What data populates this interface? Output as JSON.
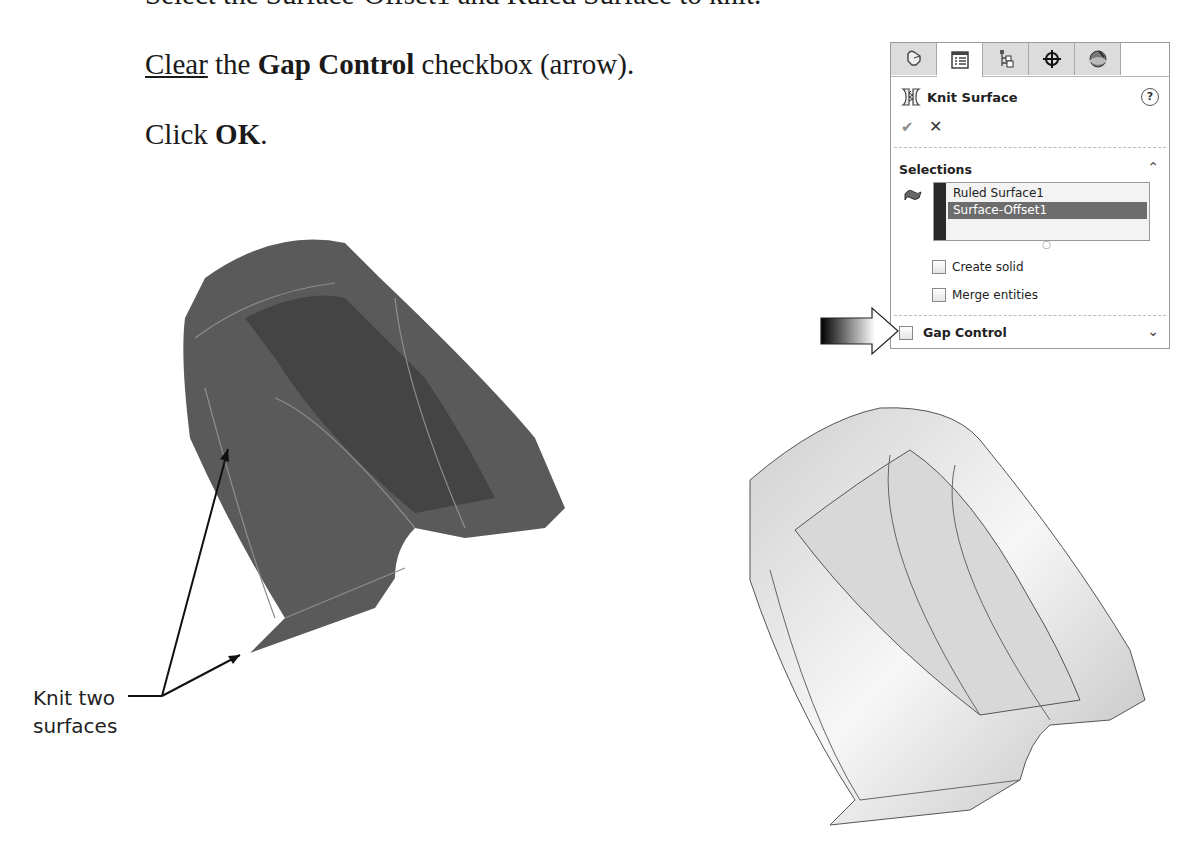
{
  "document": {
    "cut_off_line": "Select the Surface-Offset1 and Ruled Surface to knit.",
    "instruction_1": {
      "underlined": "Clear",
      "pre": " the ",
      "bold": "Gap Control",
      "post": " checkbox (arrow)."
    },
    "instruction_2": {
      "pre": "Click ",
      "bold": "OK",
      "post": "."
    }
  },
  "property_manager": {
    "tabs": [
      {
        "name": "feature-manager",
        "icon": "feature-tree-icon",
        "active": false
      },
      {
        "name": "property-manager",
        "icon": "property-manager-icon",
        "active": true
      },
      {
        "name": "configuration-manager",
        "icon": "configuration-icon",
        "active": false
      },
      {
        "name": "dimxpert-manager",
        "icon": "crosshair-icon",
        "active": false
      },
      {
        "name": "display-manager",
        "icon": "appearance-sphere-icon",
        "active": false
      }
    ],
    "title": "Knit Surface",
    "help_label": "?",
    "ok_label": "✔",
    "cancel_label": "✕",
    "selections": {
      "title": "Selections",
      "items": [
        "Ruled Surface1",
        "Surface-Offset1"
      ],
      "highlighted_index": 1
    },
    "options": [
      {
        "label": "Create solid",
        "checked": false
      },
      {
        "label": "Merge entities",
        "checked": false
      }
    ],
    "gap_control": {
      "label": "Gap Control",
      "checked": false
    }
  },
  "callout": {
    "line1": "Knit two",
    "line2": "surfaces"
  },
  "colors": {
    "model_dark": "#555555",
    "model_light": "#d4d4d4",
    "selection_highlight": "#6d6d6d",
    "selection_bar": "#2a2a2a"
  }
}
